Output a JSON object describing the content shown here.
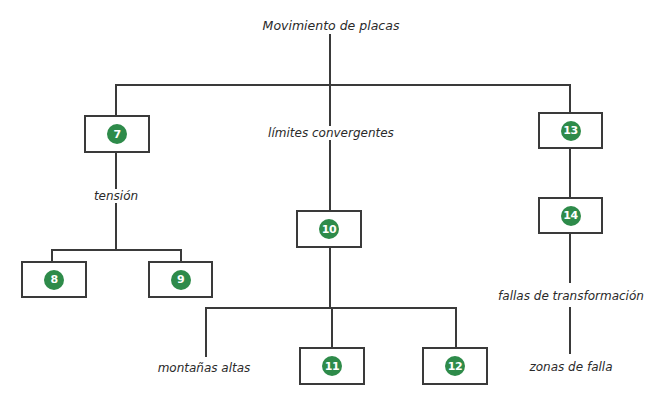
{
  "diagram": {
    "title": "Movimiento de placas",
    "accent_color": "#2e8b4a",
    "branches": {
      "left": {
        "box": {
          "number": "7"
        },
        "label": "tensión",
        "children": [
          {
            "number": "8"
          },
          {
            "number": "9"
          }
        ]
      },
      "center": {
        "label": "límites convergentes",
        "box": {
          "number": "10"
        },
        "children": [
          {
            "label": "montañas altas"
          },
          {
            "number": "11"
          },
          {
            "number": "12"
          }
        ]
      },
      "right": {
        "box_top": {
          "number": "13"
        },
        "box_bottom": {
          "number": "14"
        },
        "label": "fallas de transformación",
        "leaf": "zonas de falla"
      }
    }
  }
}
